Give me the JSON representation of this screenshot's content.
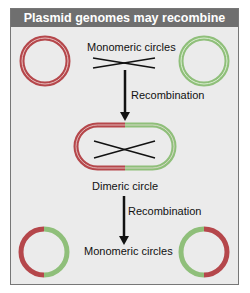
{
  "title": "Plasmid genomes may recombine",
  "labels": {
    "top": "Monomeric circles",
    "step1": "Recombination",
    "middle": "Dimeric circle",
    "step2": "Recombination",
    "bottom": "Monomeric circles"
  },
  "colors": {
    "header_bg": "#6f6f6f",
    "panel_bg": "#ebebeb",
    "plasmid_a": "#b5474b",
    "plasmid_b": "#8fbf7a"
  }
}
